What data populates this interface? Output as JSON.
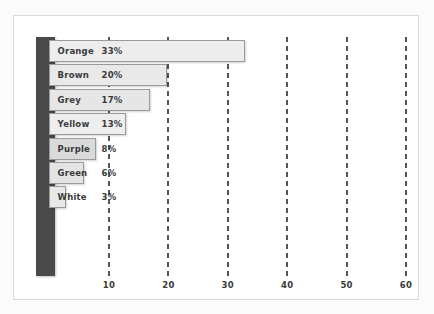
{
  "chart_data": {
    "type": "bar",
    "orientation": "horizontal",
    "title": "",
    "subtitle": "",
    "xlabel": "",
    "ylabel": "",
    "categories": [
      "Orange",
      "Brown",
      "Grey",
      "Yellow",
      "Purple",
      "Green",
      "White"
    ],
    "values": [
      33,
      20,
      17,
      13,
      8,
      6,
      3
    ],
    "value_labels": [
      "33%",
      "20%",
      "17%",
      "13%",
      "8%",
      "6%",
      "3%"
    ],
    "xlim": [
      0,
      63
    ],
    "xticks": [
      10,
      20,
      30,
      40,
      50,
      60
    ],
    "xtick_labels": [
      "10",
      "20",
      "30",
      "40",
      "50",
      "60"
    ],
    "grid": true,
    "grid_style": "dashed-vertical",
    "legend": "none",
    "bars": [
      {
        "category": "Orange",
        "value": 33,
        "value_label": "33%",
        "label_inside": true
      },
      {
        "category": "Brown",
        "value": 20,
        "value_label": "20%",
        "label_inside": true
      },
      {
        "category": "Grey",
        "value": 17,
        "value_label": "17%",
        "label_inside": true
      },
      {
        "category": "Yellow",
        "value": 13,
        "value_label": "13%",
        "label_inside": true
      },
      {
        "category": "Purple",
        "value": 8,
        "value_label": "8%",
        "label_inside": true
      },
      {
        "category": "Green",
        "value": 6,
        "value_label": "6%",
        "label_inside": false
      },
      {
        "category": "White",
        "value": 3,
        "value_label": "3%",
        "label_inside": false
      }
    ]
  },
  "colors": {
    "page_background": "#fbfbfb",
    "frame_background": "#ffffff",
    "frame_border": "#d9d9d9",
    "category_axis_band": "#4a4a4a",
    "gridline": "#555555",
    "bar_fill": "#ececec",
    "bar_border": "#9a9a9a",
    "text": "#3a3a3a"
  }
}
